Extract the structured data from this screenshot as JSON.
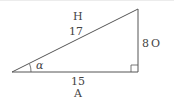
{
  "diagram": {
    "type": "right-triangle",
    "colors": {
      "stroke": "#555555",
      "text": "#444444",
      "background": "#ffffff"
    },
    "vertices": {
      "angle_vertex": [
        12,
        71
      ],
      "right_angle_vertex": [
        138,
        71
      ],
      "top_vertex": [
        138,
        8
      ]
    },
    "angle_label": "α",
    "sides": {
      "hypotenuse": {
        "name": "H",
        "length": "17"
      },
      "opposite": {
        "name": "O",
        "length": "8"
      },
      "adjacent": {
        "name": "A",
        "length": "15"
      }
    }
  }
}
